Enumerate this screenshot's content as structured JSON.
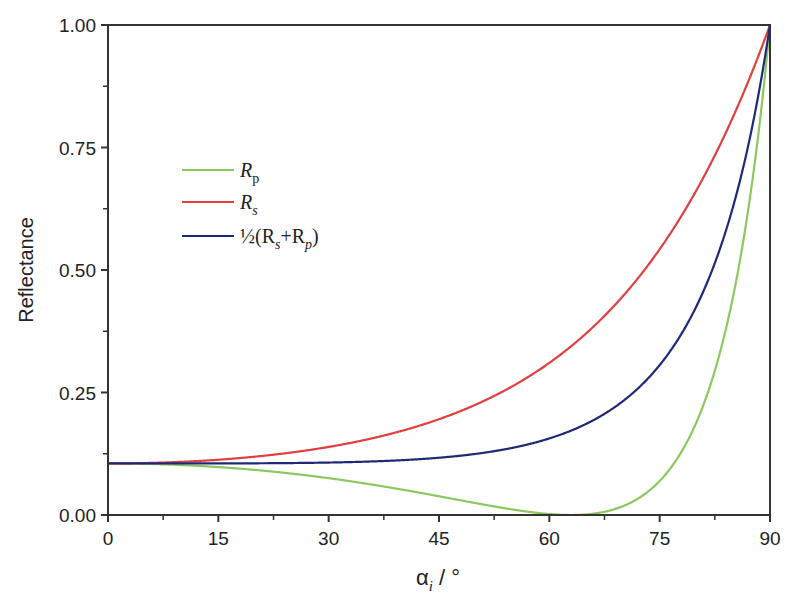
{
  "chart_data": {
    "type": "line",
    "title": "",
    "xlabel": "αi / °",
    "ylabel": "Reflectance",
    "xlim": [
      0,
      90
    ],
    "ylim": [
      0,
      1
    ],
    "xticks": [
      "0",
      "15",
      "30",
      "45",
      "60",
      "75",
      "90"
    ],
    "yticks": [
      "0.00",
      "0.25",
      "0.50",
      "0.75",
      "1.00"
    ],
    "grid": false,
    "legend_position": "upper left",
    "x": [
      0,
      10,
      20,
      30,
      40,
      50,
      60,
      63,
      70,
      75,
      80,
      85,
      90
    ],
    "series": [
      {
        "name": "Rp",
        "color": "#8cc860",
        "values": [
          0.105,
          0.097,
          0.077,
          0.051,
          0.025,
          0.006,
          0.0003,
          0.0,
          0.02,
          0.061,
          0.179,
          0.431,
          1.0
        ]
      },
      {
        "name": "Rs",
        "color": "#e04040",
        "values": [
          0.105,
          0.113,
          0.137,
          0.183,
          0.249,
          0.345,
          0.476,
          0.535,
          0.632,
          0.715,
          0.809,
          0.905,
          1.0
        ]
      },
      {
        "name": "½(Rs+Rp)",
        "color": "#1e2a78",
        "values": [
          0.105,
          0.105,
          0.107,
          0.117,
          0.137,
          0.176,
          0.238,
          0.268,
          0.326,
          0.388,
          0.494,
          0.668,
          1.0
        ]
      }
    ]
  },
  "legend": {
    "items": [
      {
        "main": "R",
        "sub": "p",
        "color": "#8cc860"
      },
      {
        "main": "R",
        "sub": "s",
        "color": "#e04040"
      },
      {
        "main": "½(R",
        "sub": "s",
        "mid": "+R",
        "sub2": "p",
        "end": ")",
        "color": "#1e2a78"
      }
    ]
  },
  "axes": {
    "ylabel": "Reflectance",
    "xlabel_main": "α",
    "xlabel_sub": "i",
    "xlabel_unit": " / °"
  }
}
